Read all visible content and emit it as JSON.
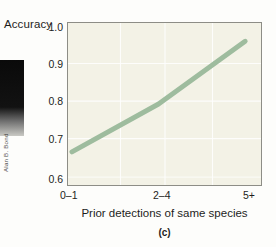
{
  "figure": {
    "panel_caption": "(c)",
    "credit": "Alan B. Bond"
  },
  "chart_data": {
    "type": "line",
    "title": "",
    "subtitle": "",
    "xlabel": "Prior detections of same species",
    "ylabel": "Accuracy",
    "categories": [
      "0–1",
      "2–4",
      "5+"
    ],
    "x_tick_labels": [
      "0–1",
      "2–4",
      "5+"
    ],
    "y_tick_labels": [
      "1.0",
      "0.9",
      "0.8",
      "0.7",
      "0.6"
    ],
    "y_ticks": [
      1.0,
      0.9,
      0.8,
      0.7,
      0.6
    ],
    "ylim": [
      0.6,
      1.0
    ],
    "xlim": [
      0,
      2
    ],
    "grid": true,
    "grid_color": "#ffffff",
    "legend": null,
    "series": [
      {
        "name": "Accuracy",
        "values": [
          0.682,
          0.8,
          0.955
        ],
        "color": "#9ebc9e",
        "line_width": 5
      }
    ],
    "plot_background": "#f3f2e6",
    "frame_color": "#8d8d86"
  }
}
